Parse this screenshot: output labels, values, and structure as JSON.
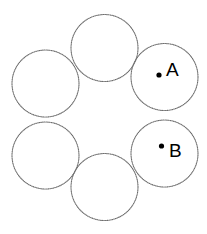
{
  "figure": {
    "title": "",
    "background_color": "#ffffff",
    "canvas": {
      "width": 207,
      "height": 234
    },
    "stroke_color": "#6e6e6e",
    "stroke_style": "dotted",
    "stroke_width": 1.15,
    "fill_color": "#ffffff",
    "marker_color": "#000000",
    "label_color": "#000000",
    "arrangement": "hexagonal-ring-of-six-tangent-circles",
    "circle_count": 6,
    "circle_radius": 33.5,
    "ring_center": {
      "x": 104.5,
      "y": 116.5
    },
    "ring_radius": 66
  },
  "circles": [
    {
      "id": "circle-top",
      "name": "top",
      "cx": 104.5,
      "cy": 48.0,
      "r": 33.5
    },
    {
      "id": "circle-upper-right",
      "name": "upper-right",
      "cx": 164.5,
      "cy": 77.0,
      "r": 33.5
    },
    {
      "id": "circle-lower-right",
      "name": "lower-right",
      "cx": 164.5,
      "cy": 153.5,
      "r": 33.5
    },
    {
      "id": "circle-bottom",
      "name": "bottom",
      "cx": 104.5,
      "cy": 187.0,
      "r": 33.5
    },
    {
      "id": "circle-lower-left",
      "name": "lower-left",
      "cx": 45.5,
      "cy": 155.5,
      "r": 33.5
    },
    {
      "id": "circle-upper-left",
      "name": "upper-left",
      "cx": 45.5,
      "cy": 83.5,
      "r": 33.5
    }
  ],
  "points": [
    {
      "id": "point-a",
      "label": "A",
      "dot": {
        "cx": 159.0,
        "cy": 75.0,
        "r": 2.6
      },
      "label_pos": {
        "x": 166,
        "y": 60
      },
      "in_circle": "circle-upper-right"
    },
    {
      "id": "point-b",
      "label": "B",
      "dot": {
        "cx": 161.5,
        "cy": 146.0,
        "r": 2.6
      },
      "label_pos": {
        "x": 169,
        "y": 141
      },
      "in_circle": "circle-lower-right"
    }
  ]
}
